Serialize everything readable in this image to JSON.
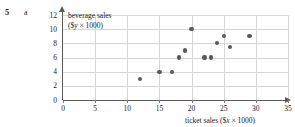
{
  "question_number": "5",
  "part_label": "a",
  "chart_data": {
    "type": "scatter",
    "title": "",
    "xlabel": "ticket sales ($x × 1000)",
    "ylabel": "beverage sales ($y × 1000)",
    "ylabel_line1": "beverage sales",
    "ylabel_line2_prefix": "($",
    "ylabel_line2_var": "y",
    "ylabel_line2_suffix": " × 1000)",
    "xlabel_prefix": "ticket sales ($",
    "xlabel_var": "x",
    "xlabel_suffix": " × 1000)",
    "xlim": [
      0,
      35
    ],
    "ylim": [
      0,
      12
    ],
    "xticks": [
      0,
      5,
      10,
      15,
      20,
      25,
      30,
      35
    ],
    "yticks": [
      0,
      2,
      4,
      6,
      8,
      10,
      12
    ],
    "grid": true,
    "grid_color": "#d7d7d7",
    "axis_color": "#5a5a5a",
    "marker_color": "#59595b",
    "x": [
      12,
      15,
      17,
      18,
      19,
      20,
      22,
      23,
      24,
      25,
      26,
      29
    ],
    "y": [
      3,
      4,
      4,
      6,
      7,
      10,
      6,
      6,
      8,
      9,
      7.5,
      9
    ],
    "points": [
      {
        "x": 12,
        "y": 3
      },
      {
        "x": 15,
        "y": 4
      },
      {
        "x": 17,
        "y": 4
      },
      {
        "x": 18,
        "y": 6
      },
      {
        "x": 19,
        "y": 7
      },
      {
        "x": 20,
        "y": 10
      },
      {
        "x": 22,
        "y": 6
      },
      {
        "x": 23,
        "y": 6
      },
      {
        "x": 24,
        "y": 8
      },
      {
        "x": 25,
        "y": 9
      },
      {
        "x": 26,
        "y": 7.5
      },
      {
        "x": 29,
        "y": 9
      }
    ]
  }
}
